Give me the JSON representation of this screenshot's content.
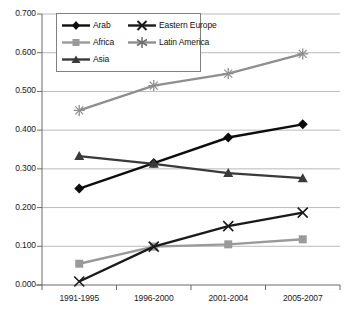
{
  "chart_data": {
    "type": "line",
    "title": "",
    "xlabel": "",
    "ylabel": "",
    "categories": [
      "1991-1995",
      "1996-2000",
      "2001-2004",
      "2005-2007"
    ],
    "ylim": [
      0.0,
      0.7
    ],
    "yticks": [
      "0.000",
      "0.100",
      "0.200",
      "0.300",
      "0.400",
      "0.500",
      "0.600",
      "0.700"
    ],
    "ytick_values": [
      0.0,
      0.1,
      0.2,
      0.3,
      0.4,
      0.5,
      0.6,
      0.7
    ],
    "grid": true,
    "legend_position": "top-left-inside",
    "series": [
      {
        "name": "Arab",
        "values": [
          0.249,
          0.315,
          0.381,
          0.415
        ],
        "color": "#0d0d0d",
        "marker": "diamond"
      },
      {
        "name": "Africa",
        "values": [
          0.055,
          0.099,
          0.105,
          0.118
        ],
        "color": "#9a9a9a",
        "marker": "square"
      },
      {
        "name": "Asia",
        "values": [
          0.333,
          0.313,
          0.289,
          0.276
        ],
        "color": "#3a3a3a",
        "marker": "triangle"
      },
      {
        "name": "Eastern Europe",
        "values": [
          0.009,
          0.099,
          0.152,
          0.187
        ],
        "color": "#1a1a1a",
        "marker": "x"
      },
      {
        "name": "Latin America",
        "values": [
          0.451,
          0.515,
          0.546,
          0.597
        ],
        "color": "#8f8f8f",
        "marker": "star"
      }
    ]
  },
  "legend": {
    "entries": [
      {
        "label": "Arab"
      },
      {
        "label": "Eastern Europe"
      },
      {
        "label": "Africa"
      },
      {
        "label": "Latin America"
      },
      {
        "label": "Asia"
      }
    ]
  },
  "axis": {
    "y_labels": [
      "0.700",
      "0.600",
      "0.500",
      "0.400",
      "0.300",
      "0.200",
      "0.100",
      "0.000"
    ],
    "x_labels": [
      "1991-1995",
      "1996-2000",
      "2001-2004",
      "2005-2007"
    ]
  }
}
